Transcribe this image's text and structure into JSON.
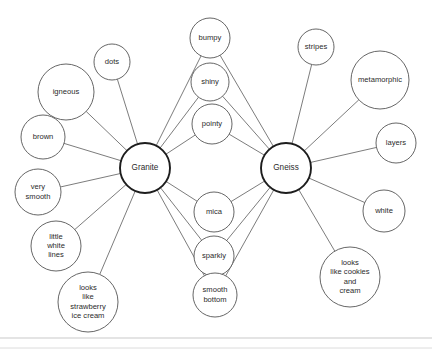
{
  "diagram": {
    "type": "concept-map",
    "canvas": {
      "width": 432,
      "height": 353,
      "background": "#ffffff"
    },
    "colors": {
      "hub_stroke": "#1d1d1d",
      "node_stroke": "#555555",
      "edge_stroke": "#5a5a5a",
      "text": "#2b2b2b",
      "frame_rule": "#c9c9c9"
    },
    "hubs": [
      {
        "id": "granite",
        "label": "Granite",
        "cx": 145,
        "cy": 168,
        "r": 25
      },
      {
        "id": "gneiss",
        "label": "Gneiss",
        "cx": 286,
        "cy": 168,
        "r": 25
      }
    ],
    "nodes": [
      {
        "id": "dots",
        "label": "dots",
        "lines": [
          "dots"
        ],
        "cx": 112,
        "cy": 62,
        "r": 18,
        "links": [
          "granite"
        ]
      },
      {
        "id": "igneous",
        "label": "igneous",
        "lines": [
          "igneous"
        ],
        "cx": 66,
        "cy": 92,
        "r": 28,
        "links": [
          "granite"
        ]
      },
      {
        "id": "brown",
        "label": "brown",
        "lines": [
          "brown"
        ],
        "cx": 43,
        "cy": 137,
        "r": 22,
        "links": [
          "granite"
        ]
      },
      {
        "id": "very-smooth",
        "label": "very smooth",
        "lines": [
          "very",
          "smooth"
        ],
        "cx": 38,
        "cy": 192,
        "r": 23,
        "links": [
          "granite"
        ]
      },
      {
        "id": "little-white-lines",
        "label": "little white lines",
        "lines": [
          "little",
          "white",
          "lines"
        ],
        "cx": 56,
        "cy": 246,
        "r": 25,
        "links": [
          "granite"
        ]
      },
      {
        "id": "looks-like-strawberry-ice-cream",
        "label": "looks like strawberry ice cream",
        "lines": [
          "looks",
          "like",
          "strawberry",
          "ice cream"
        ],
        "cx": 88,
        "cy": 302,
        "r": 30,
        "links": [
          "granite"
        ]
      },
      {
        "id": "bumpy",
        "label": "bumpy",
        "lines": [
          "bumpy"
        ],
        "cx": 210,
        "cy": 38,
        "r": 20,
        "links": [
          "granite",
          "gneiss"
        ]
      },
      {
        "id": "shiny",
        "label": "shiny",
        "lines": [
          "shiny"
        ],
        "cx": 210,
        "cy": 82,
        "r": 19,
        "links": [
          "granite",
          "gneiss"
        ]
      },
      {
        "id": "pointy",
        "label": "pointy",
        "lines": [
          "pointy"
        ],
        "cx": 212,
        "cy": 124,
        "r": 20,
        "links": [
          "granite",
          "gneiss"
        ]
      },
      {
        "id": "mica",
        "label": "mica",
        "lines": [
          "mica"
        ],
        "cx": 214,
        "cy": 212,
        "r": 20,
        "links": [
          "granite",
          "gneiss"
        ]
      },
      {
        "id": "sparkly",
        "label": "sparkly",
        "lines": [
          "sparkly"
        ],
        "cx": 214,
        "cy": 256,
        "r": 20,
        "links": [
          "granite",
          "gneiss"
        ]
      },
      {
        "id": "smooth-bottom",
        "label": "smooth bottom",
        "lines": [
          "smooth",
          "bottom"
        ],
        "cx": 215,
        "cy": 295,
        "r": 22,
        "links": [
          "granite",
          "gneiss"
        ]
      },
      {
        "id": "stripes",
        "label": "stripes",
        "lines": [
          "stripes"
        ],
        "cx": 316,
        "cy": 47,
        "r": 18,
        "links": [
          "gneiss"
        ]
      },
      {
        "id": "metamorphic",
        "label": "metamorphic",
        "lines": [
          "metamorphic"
        ],
        "cx": 380,
        "cy": 80,
        "r": 29,
        "links": [
          "gneiss"
        ]
      },
      {
        "id": "layers",
        "label": "layers",
        "lines": [
          "layers"
        ],
        "cx": 396,
        "cy": 143,
        "r": 20,
        "links": [
          "gneiss"
        ]
      },
      {
        "id": "white",
        "label": "white",
        "lines": [
          "white"
        ],
        "cx": 384,
        "cy": 211,
        "r": 21,
        "links": [
          "gneiss"
        ]
      },
      {
        "id": "looks-like-cookies-and-cream",
        "label": "looks like cookies and cream",
        "lines": [
          "looks",
          "like cookies",
          "and",
          "cream"
        ],
        "cx": 350,
        "cy": 277,
        "r": 30,
        "links": [
          "gneiss"
        ]
      }
    ],
    "frame": {
      "rules": [
        {
          "y": 338,
          "color": "#c9c9c9"
        },
        {
          "y": 348,
          "color": "#dcdcdc"
        }
      ]
    }
  }
}
